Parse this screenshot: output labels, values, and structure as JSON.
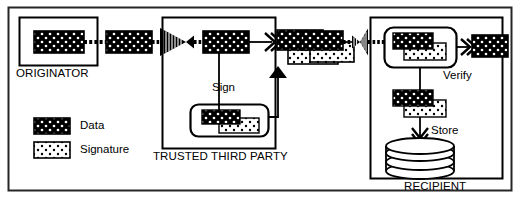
{
  "diagram": {
    "frame": {
      "stroke": "#1a1a1a"
    },
    "colors": {
      "ink": "#000000",
      "paper": "#ffffff",
      "data_fill": "#000000",
      "data_dot": "#ffffff",
      "signature_fill": "#ffffff",
      "signature_dot": "#000000"
    },
    "actors": [
      {
        "id": "originator",
        "label": "ORIGINATOR"
      },
      {
        "id": "trusted-third-party",
        "label": "TRUSTED THIRD PARTY"
      },
      {
        "id": "recipient",
        "label": "RECIPIENT"
      }
    ],
    "operations": [
      {
        "id": "sign",
        "label": "Sign"
      },
      {
        "id": "verify",
        "label": "Verify"
      },
      {
        "id": "store",
        "label": "Store"
      }
    ],
    "legend": {
      "items": [
        {
          "id": "data",
          "label": "Data",
          "swatch": "data"
        },
        {
          "id": "signature",
          "label": "Signature",
          "swatch": "signature"
        }
      ]
    },
    "blocks": [
      {
        "id": "originator-data",
        "kind": "data",
        "actor": "originator"
      },
      {
        "id": "transit-data-1",
        "kind": "data",
        "actor": "channel"
      },
      {
        "id": "ttp-input-data",
        "kind": "data",
        "actor": "trusted-third-party"
      },
      {
        "id": "ttp-signed-data",
        "kind": "data",
        "actor": "trusted-third-party"
      },
      {
        "id": "ttp-signature",
        "kind": "signature",
        "actor": "trusted-third-party"
      },
      {
        "id": "sign-box-data",
        "kind": "data",
        "actor": "trusted-third-party"
      },
      {
        "id": "sign-box-signature",
        "kind": "signature",
        "actor": "trusted-third-party"
      },
      {
        "id": "transit-data-2",
        "kind": "data",
        "actor": "channel"
      },
      {
        "id": "transit-signature-2",
        "kind": "signature",
        "actor": "channel"
      },
      {
        "id": "verify-input-data",
        "kind": "data",
        "actor": "recipient"
      },
      {
        "id": "verify-input-signature",
        "kind": "signature",
        "actor": "recipient"
      },
      {
        "id": "verify-output-data",
        "kind": "data",
        "actor": "recipient"
      },
      {
        "id": "store-data",
        "kind": "data",
        "actor": "recipient"
      },
      {
        "id": "store-signature",
        "kind": "signature",
        "actor": "recipient"
      }
    ],
    "channels": [
      {
        "id": "channel-originator-to-ttp"
      },
      {
        "id": "channel-ttp-to-recipient"
      }
    ],
    "datastore": {
      "id": "recipient-datastore",
      "kind": "disk-stack"
    }
  }
}
